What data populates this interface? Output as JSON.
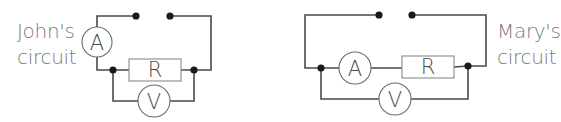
{
  "diagram": {
    "type": "circuit-comparison",
    "circuits": [
      {
        "label_line1": "John's",
        "label_line2": "circuit",
        "components": {
          "ammeter": "A",
          "resistor": "R",
          "voltmeter": "V"
        },
        "description": "Ammeter in series on main loop; voltmeter in parallel across resistor only"
      },
      {
        "label_line1": "Mary's",
        "label_line2": "circuit",
        "components": {
          "ammeter": "A",
          "resistor": "R",
          "voltmeter": "V"
        },
        "description": "Ammeter in series with resistor; voltmeter in parallel across both ammeter and resistor"
      }
    ],
    "colors": {
      "wire": "#4a4a4a",
      "node": "#1a1a1a",
      "text": "#7a7a7a"
    }
  }
}
